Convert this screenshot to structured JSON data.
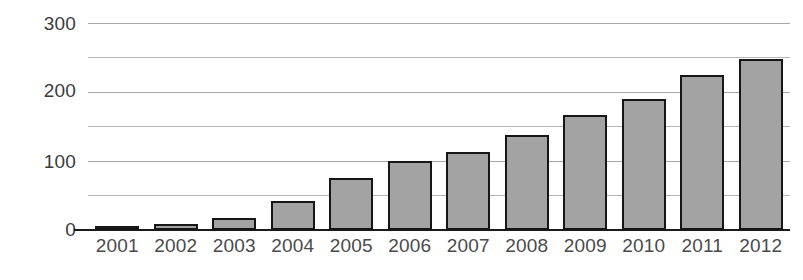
{
  "chart_data": {
    "type": "bar",
    "title": "",
    "subtitle": "",
    "xlabel": "",
    "ylabel": "",
    "categories": [
      "2001",
      "2002",
      "2003",
      "2004",
      "2005",
      "2006",
      "2007",
      "2008",
      "2009",
      "2010",
      "2011",
      "2012"
    ],
    "values": [
      4,
      9,
      17,
      42,
      75,
      100,
      113,
      138,
      167,
      189,
      225,
      247
    ],
    "series": [
      {
        "name": "",
        "values": [
          4,
          9,
          17,
          42,
          75,
          100,
          113,
          138,
          167,
          189,
          225,
          247
        ]
      }
    ],
    "ylim": [
      0,
      300
    ],
    "xlim_categories": 12,
    "y_major_ticks": [
      0,
      100,
      200,
      300
    ],
    "y_major_tick_labels": [
      "0",
      "100",
      "200",
      "300"
    ],
    "y_minor_ticks": [
      50,
      150,
      250
    ],
    "y_all_gridlines": [
      0,
      50,
      100,
      150,
      200,
      250,
      300
    ],
    "grid": "horizontal-only",
    "legend": "none",
    "legend_position": "none",
    "annotations": [],
    "bar_fill_color": "#a3a3a3",
    "bar_border_color": "#161616",
    "gridline_color": "#b7b7b7",
    "axis_color": "#1a1a1a",
    "tick_label_color": "#4a4a4a",
    "background_color": "#ffffff"
  }
}
